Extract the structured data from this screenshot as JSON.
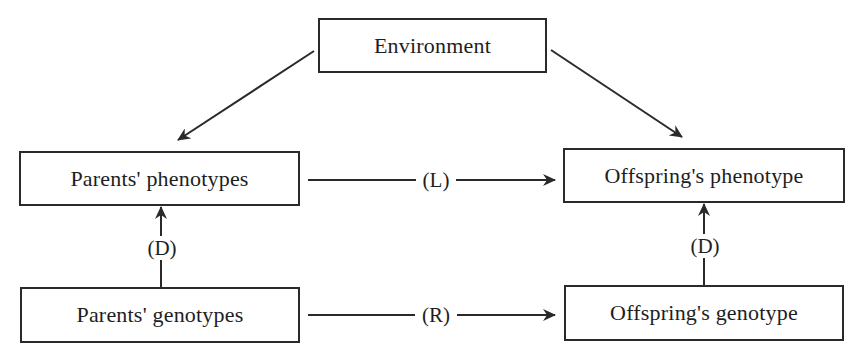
{
  "diagram": {
    "type": "flow",
    "nodes": [
      {
        "id": "environment",
        "label": "Environment"
      },
      {
        "id": "parents_phenotypes",
        "label": "Parents' phenotypes"
      },
      {
        "id": "offspring_phenotype",
        "label": "Offspring's phenotype"
      },
      {
        "id": "parents_genotypes",
        "label": "Parents' genotypes"
      },
      {
        "id": "offspring_genotype",
        "label": "Offspring's genotype"
      }
    ],
    "edges": [
      {
        "from": "environment",
        "to": "parents_phenotypes",
        "label": ""
      },
      {
        "from": "environment",
        "to": "offspring_phenotype",
        "label": ""
      },
      {
        "from": "parents_phenotypes",
        "to": "offspring_phenotype",
        "label": "(L)"
      },
      {
        "from": "parents_genotypes",
        "to": "offspring_genotype",
        "label": "(R)"
      },
      {
        "from": "parents_genotypes",
        "to": "parents_phenotypes",
        "label": "(D)"
      },
      {
        "from": "offspring_genotype",
        "to": "offspring_phenotype",
        "label": "(D)"
      }
    ]
  },
  "colors": {
    "stroke": "#2a2a2a",
    "background": "#ffffff",
    "text": "#1e1e1e"
  }
}
